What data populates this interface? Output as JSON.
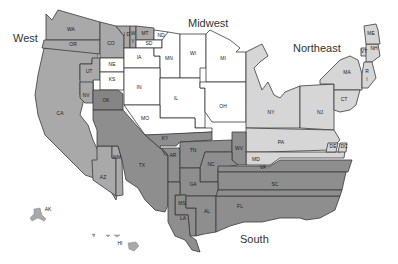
{
  "colors": {
    "west": "#a9a9a9",
    "midwest": "#ffffff",
    "northeast": "#d6d6d6",
    "south": "#8e8e8e",
    "south_dark": "#858585",
    "border": "#3a3a3a"
  },
  "regions": {
    "west": "West",
    "midwest": "Midwest",
    "northeast": "Northeast",
    "south": "South"
  },
  "states": {
    "WA": "WA",
    "OR": "OR",
    "CA": "CA",
    "NV": "NV",
    "UT": "UT",
    "CO": "CO",
    "ID": "I D",
    "WY": "W",
    "MT": "MT",
    "AZ": "AZ",
    "NM": "NM",
    "AK": "AK",
    "HI": "HI",
    "Y": "Y",
    "ND": "ND",
    "SD": "SD",
    "NE": "NE",
    "KS": "KS",
    "IA": "IA",
    "MN": "MN",
    "WI": "WI",
    "MI": "MI",
    "IL": "IL",
    "IN": "IN",
    "OH": "OH",
    "MO": "MO",
    "NY": "NY",
    "NJ": "NJ",
    "PA": "PA",
    "CT": "CT",
    "MA": "MA",
    "VT": "VT",
    "NH": "NH",
    "ME": "ME",
    "RI": "R",
    "I": "I",
    "OK": "OK",
    "TX": "TX",
    "AR": "AR",
    "LA": "LA",
    "MS": "MS",
    "AL": "AL",
    "TN": "TN",
    "KY": "KY",
    "GA": "GA",
    "FL": "FL",
    "SC": "SC",
    "NC": "NC",
    "VA": "VA",
    "WV": "WV",
    "MD": "MD",
    "DE": "DE",
    "DC": "DC"
  }
}
